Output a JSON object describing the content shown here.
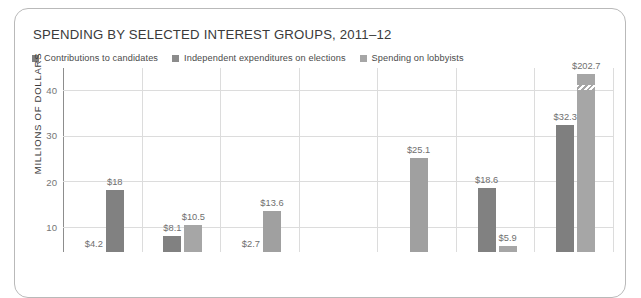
{
  "card": {
    "name": "chart-card"
  },
  "header": {
    "title": "SPENDING BY SELECTED INTEREST GROUPS, 2011–12"
  },
  "legend": {
    "items": [
      {
        "label": "Contributions to candidates",
        "color": "#7f7f7f"
      },
      {
        "label": "Independent expenditures on elections",
        "color": "#8c8c8c"
      },
      {
        "label": "Spending on lobbyists",
        "color": "#a6a6a6"
      }
    ]
  },
  "axis": {
    "y_title": "MILLIONS OF DOLLARS",
    "ticks": [
      "40",
      "30",
      "20",
      "10"
    ]
  },
  "chart_data": {
    "type": "bar",
    "title": "SPENDING BY SELECTED INTEREST GROUPS, 2011–12",
    "xlabel": "",
    "ylabel": "MILLIONS OF DOLLARS",
    "ylim": [
      0,
      44
    ],
    "ytick_values": [
      40,
      30,
      20,
      10
    ],
    "grid": true,
    "legend_position": "top-left",
    "series": [
      {
        "name": "Contributions to candidates",
        "color": "#7f7f7f"
      },
      {
        "name": "Independent expenditures on elections",
        "color": "#8c8c8c"
      },
      {
        "name": "Spending on lobbyists",
        "color": "#a6a6a6"
      }
    ],
    "bars": [
      {
        "group": 1,
        "series": "Contributions to candidates",
        "value": 4.2,
        "label": "$4.2",
        "color": "#8c8c8c"
      },
      {
        "group": 1,
        "series": "Spending on lobbyists",
        "value": 18.0,
        "label": "$18",
        "color": "#818181"
      },
      {
        "group": 2,
        "series": "Contributions to candidates",
        "value": 8.1,
        "label": "$8.1",
        "color": "#818181"
      },
      {
        "group": 2,
        "series": "Spending on lobbyists",
        "value": 10.5,
        "label": "$10.5",
        "color": "#a6a6a6"
      },
      {
        "group": 3,
        "series": "Contributions to candidates",
        "value": 2.7,
        "label": "$2.7",
        "color": "#a6a6a6"
      },
      {
        "group": 3,
        "series": "Spending on lobbyists",
        "value": 13.6,
        "label": "$13.6",
        "color": "#a0a0a0"
      },
      {
        "group": 5,
        "series": "Spending on lobbyists",
        "value": 25.1,
        "label": "$25.1",
        "color": "#a0a0a0"
      },
      {
        "group": 6,
        "series": "Contributions to candidates",
        "value": 18.6,
        "label": "$18.6",
        "color": "#818181"
      },
      {
        "group": 6,
        "series": "Spending on lobbyists",
        "value": 5.9,
        "label": "$5.9",
        "color": "#a6a6a6"
      },
      {
        "group": 7,
        "series": "Contributions to candidates",
        "value": 32.3,
        "label": "$32.3",
        "color": "#7f7f7f"
      },
      {
        "group": 7,
        "series": "Spending on lobbyists",
        "value": 202.7,
        "label": "$202.7",
        "color": "#a6a6a6",
        "broken_axis": true
      }
    ]
  }
}
